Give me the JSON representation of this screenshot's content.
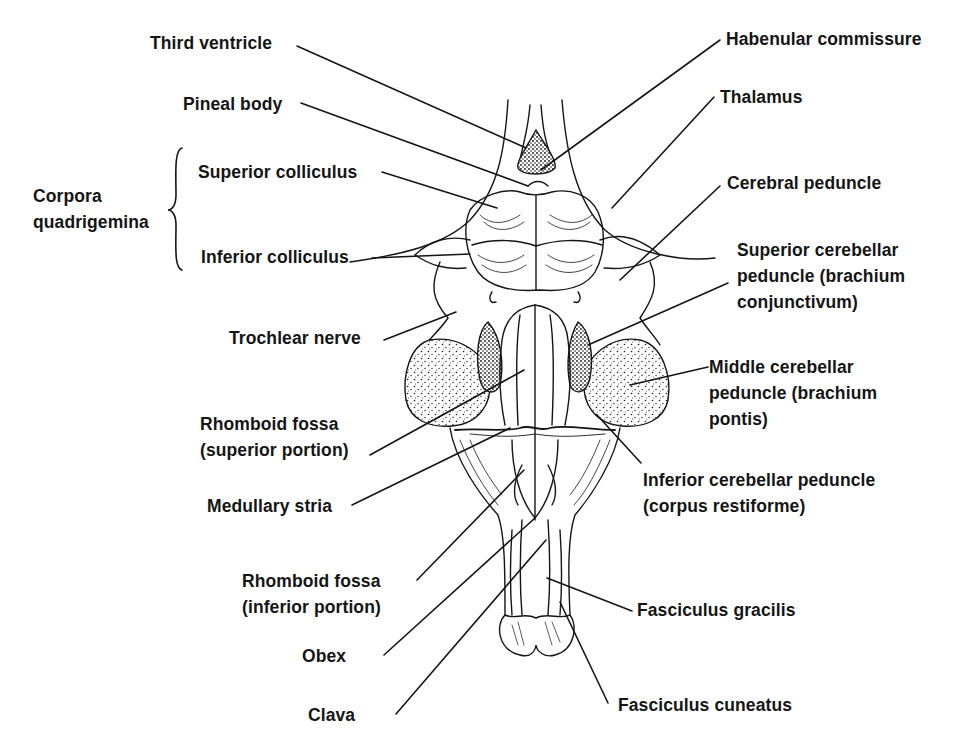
{
  "figure": {
    "colors": {
      "ink": "#151515",
      "background": "#ffffff",
      "stipple": "#333333"
    }
  },
  "labels": {
    "third_ventricle": [
      "Third ventricle"
    ],
    "pineal_body": [
      "Pineal body"
    ],
    "corpora_quadrigemina": [
      "Corpora",
      "quadrigemina"
    ],
    "superior_colliculus": [
      "Superior colliculus"
    ],
    "inferior_colliculus": [
      "Inferior colliculus"
    ],
    "trochlear_nerve": [
      "Trochlear nerve"
    ],
    "rhomboid_fossa_superior": [
      "Rhomboid fossa",
      "(superior portion)"
    ],
    "medullary_stria": [
      "Medullary stria"
    ],
    "rhomboid_fossa_inferior": [
      "Rhomboid fossa",
      "(inferior portion)"
    ],
    "obex": [
      "Obex"
    ],
    "clava": [
      "Clava"
    ],
    "habenular_commissure": [
      "Habenular commissure"
    ],
    "thalamus": [
      "Thalamus"
    ],
    "cerebral_peduncle": [
      "Cerebral peduncle"
    ],
    "superior_cerebellar_peduncle": [
      "Superior cerebellar",
      "peduncle (brachium",
      "conjunctivum)"
    ],
    "middle_cerebellar_peduncle": [
      "Middle cerebellar",
      "peduncle (brachium",
      "pontis)"
    ],
    "inferior_cerebellar_peduncle": [
      "Inferior cerebellar peduncle",
      "(corpus restiforme)"
    ],
    "fasciculus_gracilis": [
      "Fasciculus gracilis"
    ],
    "fasciculus_cuneatus": [
      "Fasciculus cuneatus"
    ]
  }
}
